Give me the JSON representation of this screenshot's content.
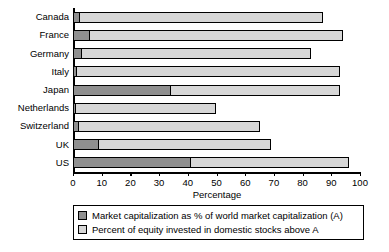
{
  "chart_data": {
    "type": "bar",
    "orientation": "horizontal",
    "stacked": true,
    "title": "",
    "xlabel": "Percentage",
    "ylabel": "",
    "xlim": [
      0,
      100
    ],
    "xticks": [
      0,
      10,
      20,
      30,
      40,
      50,
      60,
      70,
      80,
      90,
      100
    ],
    "grid": false,
    "legend_position": "below-axis",
    "categories": [
      "Canada",
      "France",
      "Germany",
      "Italy",
      "Japan",
      "Netherlands",
      "Switzerland",
      "UK",
      "US"
    ],
    "series": [
      {
        "name": "Market capitalization as % of world market capitalization (A)",
        "color": "#8f8f8f",
        "values": [
          2.5,
          6,
          3,
          1.5,
          34,
          1,
          2,
          9,
          41
        ]
      },
      {
        "name": "Percent of equity invested in domestic stocks above A",
        "color": "#d7d7d7",
        "values": [
          84.5,
          88,
          80,
          91.5,
          59,
          49,
          63,
          60,
          55
        ]
      }
    ],
    "totals": [
      87,
      94,
      83,
      93,
      93,
      50,
      65,
      69,
      96
    ]
  },
  "legend": {
    "items": [
      {
        "label": "Market capitalization as % of world market capitalization (A)",
        "color": "#8f8f8f"
      },
      {
        "label": "Percent of equity invested in domestic stocks above A",
        "color": "#d7d7d7"
      }
    ]
  }
}
